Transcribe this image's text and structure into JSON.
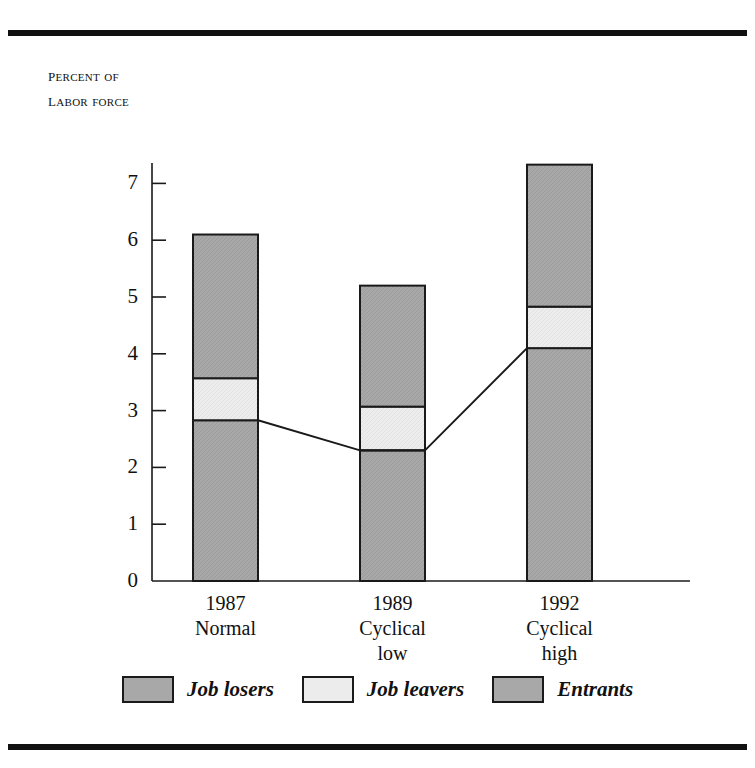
{
  "axis_caption": {
    "line1": "Percent of",
    "line2": "Labor force"
  },
  "colors": {
    "losers": "#a8a8a8",
    "leavers": "#ececec",
    "entrants": "#a8a8a8",
    "outline": "#1a1a1a",
    "axis": "#1a1a1a",
    "rule": "#111111"
  },
  "legend": {
    "items": [
      {
        "label": "Job losers",
        "key": "losers"
      },
      {
        "label": "Job leavers",
        "key": "leavers"
      },
      {
        "label": "Entrants",
        "key": "entrants"
      }
    ]
  },
  "chart_data": {
    "type": "bar",
    "title": "",
    "subtitle": "",
    "xlabel": "",
    "ylabel": "Percent of labor force",
    "ylim": [
      0,
      7.6
    ],
    "yticks": [
      0,
      1,
      2,
      3,
      4,
      5,
      6,
      7
    ],
    "ytick_labels": [
      "0",
      "1",
      "2",
      "3",
      "4",
      "5",
      "6",
      "7"
    ],
    "grid": false,
    "stacked": true,
    "legend_position": "bottom",
    "categories": [
      "1987",
      "1989",
      "1992"
    ],
    "category_sublabels": [
      [
        "Normal"
      ],
      [
        "Cyclical",
        "low"
      ],
      [
        "Cyclical",
        "high"
      ]
    ],
    "series": [
      {
        "name": "Job losers",
        "values": [
          2.83,
          2.3,
          4.1
        ]
      },
      {
        "name": "Job leavers",
        "values": [
          0.74,
          0.77,
          0.73
        ]
      },
      {
        "name": "Entrants",
        "values": [
          2.53,
          2.13,
          2.5
        ]
      }
    ],
    "totals": [
      6.1,
      5.2,
      7.33
    ],
    "annotation_line": {
      "description": "line connecting top of Job losers segment across categories",
      "values": [
        2.83,
        2.3,
        4.1
      ]
    }
  }
}
